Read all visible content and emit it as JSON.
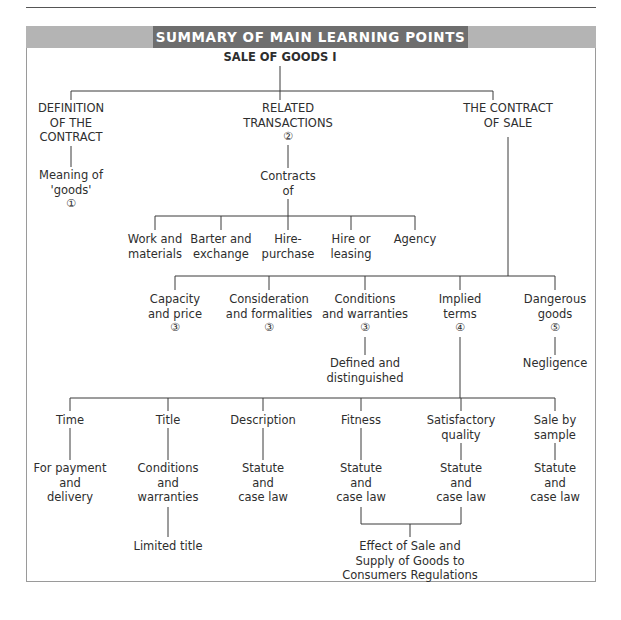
{
  "banner": {
    "title": "SUMMARY OF MAIN LEARNING POINTS"
  },
  "root": {
    "label": "SALE OF GOODS I"
  },
  "level1": [
    {
      "lines": [
        "DEFINITION",
        "OF THE",
        "CONTRACT"
      ]
    },
    {
      "lines": [
        "RELATED",
        "TRANSACTIONS"
      ],
      "ref": "②"
    },
    {
      "lines": [
        "THE CONTRACT",
        "OF SALE"
      ]
    }
  ],
  "definition_children": [
    {
      "lines": [
        "Meaning of",
        "'goods'"
      ],
      "ref": "①"
    }
  ],
  "related_children": [
    {
      "lines": [
        "Contracts",
        "of"
      ]
    }
  ],
  "contracts_of": [
    {
      "lines": [
        "Work and",
        "materials"
      ]
    },
    {
      "lines": [
        "Barter and",
        "exchange"
      ]
    },
    {
      "lines": [
        "Hire-",
        "purchase"
      ]
    },
    {
      "lines": [
        "Hire or",
        "leasing"
      ]
    },
    {
      "lines": [
        "Agency"
      ]
    }
  ],
  "contract_of_sale": [
    {
      "lines": [
        "Capacity",
        "and price"
      ],
      "ref": "③"
    },
    {
      "lines": [
        "Consideration",
        "and formalities"
      ],
      "ref": "③"
    },
    {
      "lines": [
        "Conditions",
        "and warranties"
      ],
      "ref": "③",
      "child": [
        "Defined and",
        "distinguished"
      ]
    },
    {
      "lines": [
        "Implied",
        "terms"
      ],
      "ref": "④"
    },
    {
      "lines": [
        "Dangerous",
        "goods"
      ],
      "ref": "⑤",
      "child": [
        "Negligence"
      ]
    }
  ],
  "implied_terms": [
    {
      "lines": [
        "Time"
      ],
      "child": [
        "For payment",
        "and",
        "delivery"
      ]
    },
    {
      "lines": [
        "Title"
      ],
      "child": [
        "Conditions",
        "and",
        "warranties"
      ],
      "grandchild": [
        "Limited title"
      ]
    },
    {
      "lines": [
        "Description"
      ],
      "child": [
        "Statute",
        "and",
        "case law"
      ]
    },
    {
      "lines": [
        "Fitness"
      ],
      "child": [
        "Statute",
        "and",
        "case law"
      ]
    },
    {
      "lines": [
        "Satisfactory",
        "quality"
      ],
      "child": [
        "Statute",
        "and",
        "case law"
      ]
    },
    {
      "lines": [
        "Sale by",
        "sample"
      ],
      "child": [
        "Statute",
        "and",
        "case law"
      ]
    }
  ],
  "joint_child": {
    "lines": [
      "Effect of Sale and",
      "Supply of Goods to",
      "Consumers Regulations"
    ]
  }
}
